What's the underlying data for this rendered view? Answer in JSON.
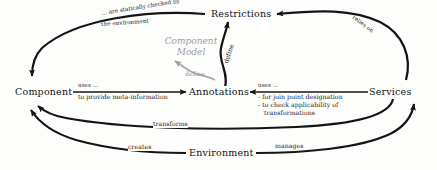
{
  "diagram": {
    "type": "component-model-concept-diagram",
    "background_color": "#fdfdfc",
    "line_color": "#141414",
    "muted_color": "#9c9c9c",
    "nodes": [
      {
        "id": "component",
        "label": "Component"
      },
      {
        "id": "annotations",
        "label": "Annotations"
      },
      {
        "id": "restrictions",
        "label": "Restrictions"
      },
      {
        "id": "services",
        "label": "Services"
      },
      {
        "id": "environment",
        "label": "Environment"
      }
    ],
    "center_note": {
      "line1": "Component",
      "line2": "Model"
    },
    "edges": [
      {
        "id": "component-to-annotations",
        "from": "Component",
        "to": "Annotations",
        "label_above": "uses ...",
        "label_below": "to provide meta-information"
      },
      {
        "id": "services-to-annotations",
        "from": "Services",
        "to": "Annotations",
        "label_above": "uses ...",
        "bullet1": "- for join point designation",
        "bullet2": "- to check applicability of",
        "bullet3": "transformations"
      },
      {
        "id": "annotations-to-restrictions",
        "from": "Annotations",
        "to": "Restrictions",
        "label": "define"
      },
      {
        "id": "componentmodel-define",
        "from": "Component Model",
        "to": "Component Model",
        "label": "define"
      },
      {
        "id": "restrictions-to-component",
        "from": "Restrictions",
        "to": "Component",
        "label_line1": "... are statically checked by",
        "label_line2": "the environment"
      },
      {
        "id": "services-to-restrictions",
        "from": "Services",
        "to": "Restrictions",
        "label": "relies on"
      },
      {
        "id": "services-to-component",
        "from": "Services",
        "to": "Component",
        "label": "transforms"
      },
      {
        "id": "environment-to-component",
        "from": "Environment",
        "to": "Component",
        "label": "creates"
      },
      {
        "id": "environment-to-services",
        "from": "Environment",
        "to": "Services",
        "label": "manages"
      }
    ]
  }
}
